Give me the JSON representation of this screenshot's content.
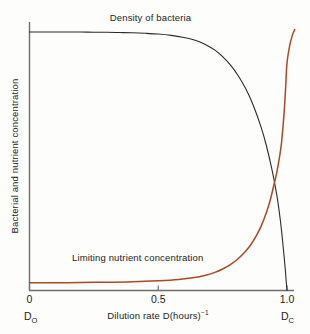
{
  "chart_data": {
    "type": "line",
    "title": "",
    "subtitle": "",
    "xlabel": "Dilution rate D(hours)",
    "xlabel_sup": "−1",
    "ylabel": "Bacterial and nutrient concentration",
    "xlim": [
      0,
      1.06
    ],
    "ylim": [
      0,
      1.06
    ],
    "grid": false,
    "legend_position": "inline-annotation",
    "x_ticks": [
      "0",
      "0.5",
      "1.0"
    ],
    "x_tick_values": [
      0,
      0.5,
      1.0
    ],
    "y_ticks": [],
    "endpoint_labels": [
      {
        "text": "D",
        "sub": "O",
        "x_value": 0
      },
      {
        "text": "D",
        "sub": "C",
        "x_value": 1.0
      }
    ],
    "annotations": [
      {
        "text": "Density of bacteria",
        "x_value": 0.47,
        "y_value": 1.02
      },
      {
        "text": "Limiting nutrient concentration",
        "x_value": 0.42,
        "y_value": 0.09
      }
    ],
    "series": [
      {
        "name": "Density of bacteria",
        "color": "#2b2b2b",
        "x": [
          0.0,
          0.05,
          0.1,
          0.15,
          0.2,
          0.25,
          0.3,
          0.35,
          0.4,
          0.45,
          0.5,
          0.55,
          0.6,
          0.63,
          0.66,
          0.69,
          0.72,
          0.75,
          0.78,
          0.81,
          0.84,
          0.87,
          0.9,
          0.92,
          0.94,
          0.955,
          0.965,
          0.975,
          0.982,
          0.988,
          0.993,
          0.997,
          1.0
        ],
        "y": [
          1.0,
          1.0,
          1.0,
          1.0,
          1.0,
          0.999,
          0.999,
          0.998,
          0.997,
          0.995,
          0.992,
          0.987,
          0.979,
          0.972,
          0.962,
          0.948,
          0.93,
          0.905,
          0.873,
          0.832,
          0.78,
          0.714,
          0.63,
          0.56,
          0.475,
          0.4,
          0.34,
          0.265,
          0.2,
          0.14,
          0.085,
          0.035,
          0.0
        ]
      },
      {
        "name": "Limiting nutrient concentration",
        "color": "#a8492a",
        "x": [
          0.0,
          0.1,
          0.2,
          0.3,
          0.4,
          0.5,
          0.58,
          0.64,
          0.68,
          0.72,
          0.75,
          0.78,
          0.81,
          0.84,
          0.86,
          0.88,
          0.9,
          0.92,
          0.935,
          0.95,
          0.96,
          0.97,
          0.978,
          0.985,
          0.99,
          0.995,
          1.0,
          1.01,
          1.02,
          1.03
        ],
        "y": [
          0.03,
          0.03,
          0.031,
          0.032,
          0.034,
          0.038,
          0.043,
          0.05,
          0.058,
          0.07,
          0.083,
          0.1,
          0.123,
          0.153,
          0.178,
          0.21,
          0.25,
          0.302,
          0.35,
          0.412,
          0.455,
          0.51,
          0.565,
          0.64,
          0.705,
          0.79,
          0.88,
          0.945,
          0.985,
          1.01
        ]
      }
    ]
  },
  "axes": {
    "axis_color": "#6e6e6e",
    "background_color": "#fdfdfb"
  }
}
